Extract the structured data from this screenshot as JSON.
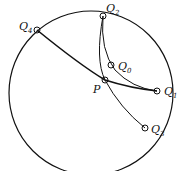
{
  "diagram": {
    "type": "hyperbolic-disk-geodesics",
    "circle": {
      "cx": 90,
      "cy": 93,
      "r": 82
    },
    "points": {
      "Q4": {
        "label": "Q",
        "sub": "4",
        "x": 37,
        "y": 30
      },
      "Q2": {
        "label": "Q",
        "sub": "2",
        "x": 103,
        "y": 16
      },
      "Q0": {
        "label": "Q",
        "sub": "0",
        "x": 111,
        "y": 65
      },
      "P": {
        "label": "P",
        "x": 105,
        "y": 80
      },
      "Q1": {
        "label": "Q",
        "sub": "1",
        "x": 157,
        "y": 91
      },
      "Q3": {
        "label": "Q",
        "sub": "3",
        "x": 145,
        "y": 128
      }
    },
    "colors": {
      "stroke": "#111111",
      "background": "#ffffff"
    }
  }
}
